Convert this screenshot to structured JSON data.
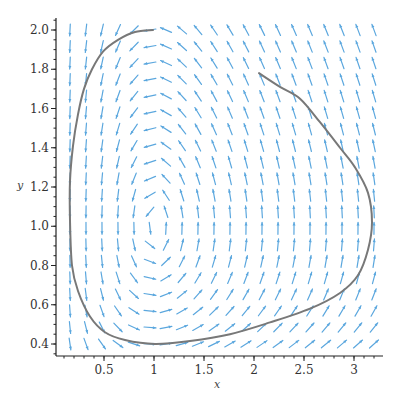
{
  "chart_data": {
    "type": "line",
    "subtype": "phase-portrait-with-direction-field",
    "title": "",
    "xlabel": "x",
    "ylabel": "y",
    "xlim": [
      0.02,
      3.3
    ],
    "ylim": [
      0.34,
      2.06
    ],
    "x_ticks": [
      "0.5",
      "1",
      "1.5",
      "2",
      "2.5",
      "3"
    ],
    "x_tick_values": [
      0.5,
      1,
      1.5,
      2,
      2.5,
      3
    ],
    "y_ticks": [
      "0.4",
      "0.6",
      "0.8",
      "1.0",
      "1.2",
      "1.4",
      "1.6",
      "1.8",
      "2.0"
    ],
    "y_tick_values": [
      0.4,
      0.6,
      0.8,
      1.0,
      1.2,
      1.4,
      1.6,
      1.8,
      2.0
    ],
    "grid": false,
    "legend": null,
    "direction_field": {
      "system": "dx/dt = x(1 - y), dy/dt = y(x - 1)",
      "equilibrium": [
        1,
        1
      ],
      "x_range": [
        0.16,
        3.2
      ],
      "y_range": [
        0.4,
        2.0
      ],
      "columns": 20,
      "rows": 20,
      "color": "#5ba7de"
    },
    "series": [
      {
        "name": "trajectory",
        "color": "#787878",
        "points": [
          [
            2.05,
            1.78
          ],
          [
            2.26,
            1.71
          ],
          [
            2.46,
            1.65
          ],
          [
            2.66,
            1.53
          ],
          [
            2.86,
            1.4
          ],
          [
            3.01,
            1.3
          ],
          [
            3.14,
            1.17
          ],
          [
            3.18,
            1.02
          ],
          [
            3.14,
            0.88
          ],
          [
            3.04,
            0.75
          ],
          [
            2.86,
            0.66
          ],
          [
            2.56,
            0.58
          ],
          [
            2.16,
            0.51
          ],
          [
            1.76,
            0.45
          ],
          [
            1.36,
            0.415
          ],
          [
            1.01,
            0.4
          ],
          [
            0.71,
            0.42
          ],
          [
            0.51,
            0.46
          ],
          [
            0.36,
            0.54
          ],
          [
            0.24,
            0.67
          ],
          [
            0.18,
            0.8
          ],
          [
            0.16,
            1.03
          ],
          [
            0.16,
            1.23
          ],
          [
            0.19,
            1.41
          ],
          [
            0.24,
            1.57
          ],
          [
            0.3,
            1.7
          ],
          [
            0.38,
            1.8
          ],
          [
            0.49,
            1.89
          ],
          [
            0.64,
            1.95
          ],
          [
            0.81,
            1.99
          ],
          [
            0.99,
            2.0
          ]
        ]
      }
    ]
  },
  "layout": {
    "plot_px": {
      "x0_px": 54,
      "px_per_x": 100,
      "y2_px": 30,
      "px_per_y": 196.25
    },
    "axis_px": {
      "left": 56,
      "right": 383,
      "top": 18,
      "bottom": 356
    }
  }
}
